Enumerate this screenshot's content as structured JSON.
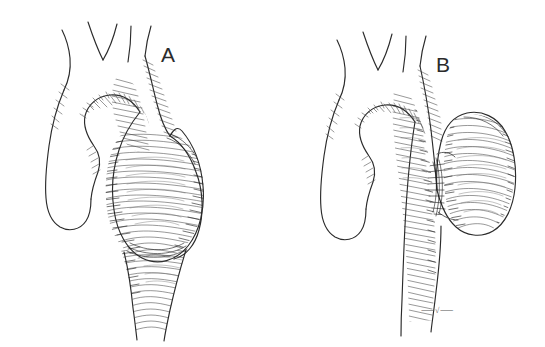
{
  "figure": {
    "medium": "pen-and-ink line drawing",
    "background_color": "#ffffff",
    "ink_color": "#2b2b2b",
    "width": 545,
    "height": 347
  },
  "panels": [
    {
      "id": "A",
      "label": "A",
      "label_x": 168,
      "label_y": 62,
      "aneurysm_type": "fusiform",
      "description": "Aortic arch with large fusiform (spindle-shaped) aneurysm of the descending thoracic aorta",
      "branch_count": 3
    },
    {
      "id": "B",
      "label": "B",
      "label_x": 443,
      "label_y": 72,
      "aneurysm_type": "saccular",
      "description": "Aortic arch with saccular (sac-like) aneurysm arising from the lateral wall of the descending thoracic aorta",
      "branch_count": 3
    }
  ],
  "signature": {
    "text": "⸺√⸺",
    "x": 421,
    "y": 313,
    "note": "artist initials mark at lower edge of panel B"
  },
  "anatomy_labels": {
    "branches": [
      "brachiocephalic trunk",
      "left common carotid artery",
      "left subclavian artery"
    ],
    "ascending_aorta": "ascending aorta",
    "aortic_arch": "aortic arch",
    "descending_aorta": "descending thoracic aorta"
  }
}
